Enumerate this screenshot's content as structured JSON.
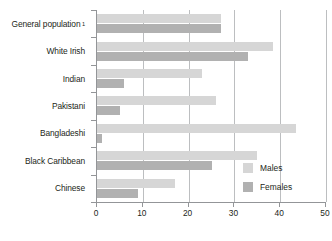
{
  "chart_data": {
    "type": "bar",
    "orientation": "horizontal",
    "title": "",
    "xlabel": "",
    "ylabel": "",
    "xlim": [
      0,
      50
    ],
    "xticks": [
      0,
      10,
      20,
      30,
      40,
      50
    ],
    "xtick_labels": [
      "0",
      "10",
      "20",
      "30",
      "40",
      "50"
    ],
    "grid": "vertical",
    "legend_position": "inside-bottom-right",
    "categories": [
      "General population",
      "White Irish",
      "Indian",
      "Pakistani",
      "Bangladeshi",
      "Black Caribbean",
      "Chinese"
    ],
    "category_footnotes": [
      "1",
      "",
      "",
      "",
      "",
      "",
      ""
    ],
    "series": [
      {
        "name": "Males",
        "color": "#d6d6d6",
        "values": [
          27,
          38.5,
          23,
          26,
          43.5,
          35,
          17
        ]
      },
      {
        "name": "Females",
        "color": "#b1b1b1",
        "values": [
          27,
          33,
          6,
          5,
          1,
          25,
          9
        ]
      }
    ]
  },
  "legend": {
    "entries": [
      {
        "label": "Males",
        "swatch": "males"
      },
      {
        "label": "Females",
        "swatch": "females"
      }
    ]
  },
  "colors": {
    "males": "#d6d6d6",
    "females": "#b1b1b1",
    "axis": "#939598",
    "gridline": "#bcbec0",
    "text": "#231f20",
    "background": "#ffffff"
  }
}
